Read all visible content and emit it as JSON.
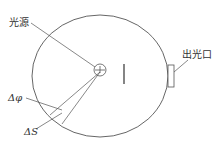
{
  "diagram": {
    "type": "integrating-sphere-schematic",
    "labels": {
      "light_source": "光源",
      "exit_port": "出光口",
      "delta_phi": "Δφ",
      "delta_s": "ΔS"
    },
    "colors": {
      "stroke": "#555555",
      "text": "#333333",
      "background": "#ffffff"
    }
  }
}
